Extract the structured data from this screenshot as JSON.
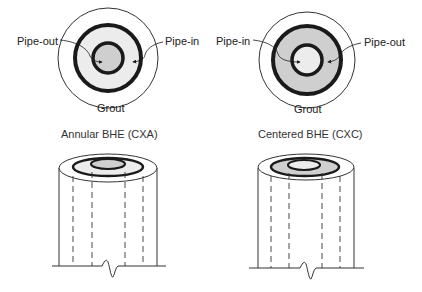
{
  "diagrams": [
    {
      "caption": "Annular BHE (CXA)",
      "labels": {
        "left": "Pipe-out",
        "right": "Pipe-in",
        "bottom": "Grout"
      }
    },
    {
      "caption": "Centered BHE (CXC)",
      "labels": {
        "left": "Pipe-in",
        "right": "Pipe-out",
        "bottom": "Grout"
      }
    }
  ],
  "colors": {
    "line": "#1a1a1a",
    "light_fill": "#ececec",
    "dark_fill": "#cfcfcf"
  }
}
